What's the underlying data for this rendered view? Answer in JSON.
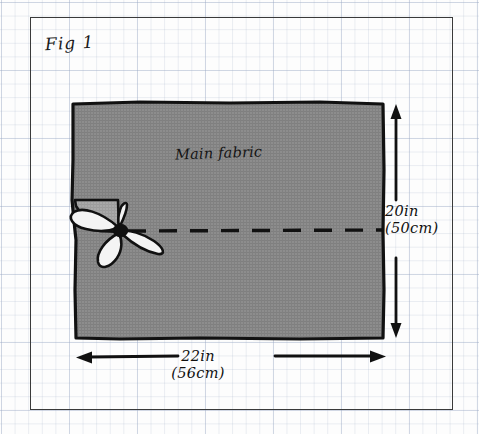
{
  "figure": {
    "title": "Fig 1",
    "type": "sewing-pattern-diagram",
    "medium": "hand-drawn on graph paper"
  },
  "labels": {
    "fabric": "Main fabric"
  },
  "dimensions": {
    "vertical": {
      "imperial": "20in",
      "metric": "(50cm)",
      "orientation": "height",
      "arrow": "double-headed"
    },
    "horizontal": {
      "imperial": "22in",
      "metric": "(56cm)",
      "orientation": "width",
      "arrow": "double-headed"
    }
  },
  "elements": {
    "seam_line": "dashed-fold-line",
    "tie": "ribbon-bow",
    "flap": "folded-corner-flap"
  },
  "colors": {
    "fabric_fill": "#8d8d8d",
    "fabric_flap": "#a8a8a8",
    "ink": "#111111",
    "frame": "#3a3a3a",
    "grid": "#9babc3",
    "paper": "#fdfdfd"
  }
}
